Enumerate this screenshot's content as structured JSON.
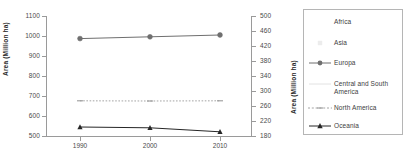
{
  "chart_data": {
    "type": "line",
    "title": "",
    "xlabel": "",
    "ylabel": "Area (Million ha)",
    "ylabel_right": "Area (Million ha)",
    "x": [
      1990,
      2000,
      2010
    ],
    "xticklabels": [
      "1990",
      "2000",
      "2010"
    ],
    "ylim": [
      500,
      1100
    ],
    "yticks": [
      500,
      600,
      700,
      800,
      900,
      1000,
      1100
    ],
    "yticklabels": [
      "500",
      "600",
      "700",
      "800",
      "900",
      "1000",
      "1100"
    ],
    "ylim_right": [
      180,
      500
    ],
    "yticks_right": [
      180,
      220,
      260,
      300,
      340,
      380,
      420,
      460,
      500
    ],
    "yticklabels_right": [
      "180",
      "220",
      "260",
      "300",
      "340",
      "380",
      "420",
      "460",
      "500"
    ],
    "grid": false,
    "legend_position": "right",
    "series": [
      {
        "name": "Africa",
        "axis": "left",
        "values": [
          null,
          null,
          null
        ],
        "color": "#ffffff",
        "marker": "none",
        "linestyle": "none"
      },
      {
        "name": "Asia",
        "axis": "right",
        "values": [
          592,
          590,
          593
        ],
        "color": "#ededed",
        "marker": "square",
        "linestyle": "solid"
      },
      {
        "name": "Europa",
        "axis": "left",
        "values": [
          987,
          996,
          1005
        ],
        "color": "#6f6f6f",
        "marker": "circle",
        "linestyle": "solid"
      },
      {
        "name": "Central and South\nAmerica",
        "axis": "right",
        "values": [
          null,
          null,
          null
        ],
        "color": "#dcdcdc",
        "marker": "none",
        "linestyle": "solid"
      },
      {
        "name": "North America",
        "axis": "left",
        "values": [
          676,
          675,
          676
        ],
        "color": "#9a9a9a",
        "marker": "dash",
        "linestyle": "dotted"
      },
      {
        "name": "Oceania",
        "axis": "left",
        "values": [
          545,
          541,
          521
        ],
        "color": "#262626",
        "marker": "triangle",
        "linestyle": "solid"
      }
    ]
  },
  "legend": {
    "items": [
      {
        "label": "Africa",
        "marker": "none"
      },
      {
        "label": "Asia",
        "marker": "square-faint"
      },
      {
        "label": "Europa",
        "marker": "circle-line"
      },
      {
        "label": "Central and South\nAmerica",
        "marker": "faint-line"
      },
      {
        "label": "North America",
        "marker": "dotted-line"
      },
      {
        "label": "Oceania",
        "marker": "triangle-line"
      }
    ]
  }
}
